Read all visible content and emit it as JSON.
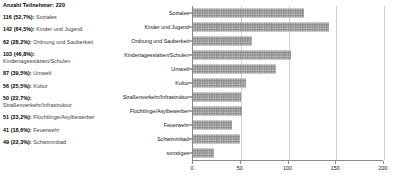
{
  "legend": {
    "title": "Anzahl Teilnehmer: 220",
    "items": [
      {
        "count": "116 (52,7%):",
        "label": "Soziales"
      },
      {
        "count": "142 (64,5%):",
        "label": "Kinder und Jugend"
      },
      {
        "count": "62 (28,2%):",
        "label": "Ordnung und Sauberkeit"
      },
      {
        "count": "103 (46,8%):",
        "label": "Kindertagesstätten/Schulen"
      },
      {
        "count": "87 (39,5%):",
        "label": "Umwelt"
      },
      {
        "count": "56 (25,5%):",
        "label": "Kultur"
      },
      {
        "count": "50 (22,7%):",
        "label": "Straßenverkehr/Infrastruktur"
      },
      {
        "count": "51 (23,2%):",
        "label": "Flüchtlinge/Asylbewerber"
      },
      {
        "count": "41 (18,6%):",
        "label": "Feuerwehr"
      },
      {
        "count": "49 (22,3%):",
        "label": "Schwimmbad"
      }
    ]
  },
  "chart_data": {
    "type": "bar",
    "orientation": "horizontal",
    "title": "",
    "xlabel": "",
    "ylabel": "",
    "xlim": [
      0,
      200
    ],
    "xticks": [
      0,
      50,
      100,
      150,
      200
    ],
    "xtick_labels": [
      "0",
      "50",
      "100",
      "150",
      "200"
    ],
    "grid": true,
    "legend_position": "none",
    "bar_color": "#8f8f8f",
    "categories": [
      "Soziales",
      "Kinder und Jugend",
      "Ordnung und Sauberkeit",
      "Kindertagesstätten/Schulen",
      "Umwelt",
      "Kultur",
      "Straßenverkehr/Infrastruktur",
      "Flüchtlinge/Asylbewerber",
      "Feuerwehr",
      "Schwimmbad",
      "sonstiges"
    ],
    "values": [
      116,
      142,
      62,
      103,
      87,
      56,
      50,
      51,
      41,
      49,
      22
    ]
  }
}
